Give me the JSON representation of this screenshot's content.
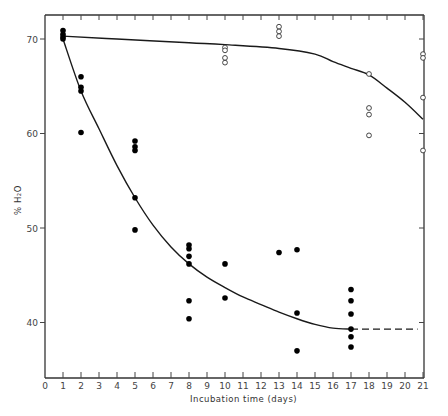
{
  "chart_data": {
    "type": "scatter",
    "title": "",
    "xlabel": "Incubation time (days)",
    "ylabel": "% H2O",
    "xlim": [
      0,
      21
    ],
    "ylim": [
      34,
      72
    ],
    "x_ticks": [
      0,
      1,
      2,
      3,
      4,
      5,
      6,
      7,
      8,
      9,
      10,
      11,
      12,
      13,
      14,
      15,
      16,
      17,
      18,
      19,
      20,
      21
    ],
    "y_ticks": [
      40,
      50,
      60,
      70
    ],
    "grid": false,
    "legend": null,
    "series": [
      {
        "name": "open-circles",
        "marker": "open circle",
        "points": [
          [
            10,
            69.1
          ],
          [
            10,
            68.8
          ],
          [
            10,
            68.0
          ],
          [
            10,
            67.5
          ],
          [
            13,
            71.3
          ],
          [
            13,
            70.8
          ],
          [
            13,
            70.3
          ],
          [
            18,
            66.3
          ],
          [
            18,
            62.7
          ],
          [
            18,
            62.0
          ],
          [
            18,
            59.8
          ],
          [
            21,
            68.4
          ],
          [
            21,
            68.0
          ],
          [
            21,
            63.8
          ],
          [
            21,
            58.2
          ]
        ]
      },
      {
        "name": "filled-circles",
        "marker": "filled circle",
        "points": [
          [
            1,
            70.9
          ],
          [
            1,
            70.5
          ],
          [
            1,
            70.2
          ],
          [
            1,
            70.0
          ],
          [
            2,
            66.0
          ],
          [
            2,
            64.9
          ],
          [
            2,
            64.5
          ],
          [
            2,
            60.1
          ],
          [
            5,
            59.2
          ],
          [
            5,
            58.6
          ],
          [
            5,
            58.2
          ],
          [
            5,
            53.2
          ],
          [
            5,
            49.8
          ],
          [
            8,
            48.2
          ],
          [
            8,
            47.8
          ],
          [
            8,
            47.0
          ],
          [
            8,
            46.2
          ],
          [
            8,
            42.3
          ],
          [
            8,
            40.4
          ],
          [
            10,
            46.2
          ],
          [
            10,
            42.6
          ],
          [
            13,
            47.4
          ],
          [
            14,
            47.7
          ],
          [
            14,
            41.0
          ],
          [
            14,
            37.0
          ],
          [
            17,
            43.5
          ],
          [
            17,
            42.3
          ],
          [
            17,
            40.9
          ],
          [
            17,
            39.3
          ],
          [
            17,
            38.5
          ],
          [
            17,
            37.4
          ]
        ]
      }
    ],
    "fitted_curves": [
      {
        "name": "open-circles-fit",
        "style": "solid",
        "points": [
          [
            1,
            70.3
          ],
          [
            4,
            70.0
          ],
          [
            8,
            69.6
          ],
          [
            10,
            69.4
          ],
          [
            13,
            69.0
          ],
          [
            15,
            68.4
          ],
          [
            16,
            67.6
          ],
          [
            17,
            66.9
          ],
          [
            18,
            66.2
          ],
          [
            19,
            64.8
          ],
          [
            20,
            63.3
          ],
          [
            21,
            61.5
          ]
        ]
      },
      {
        "name": "filled-circles-fit",
        "style": "solid",
        "points": [
          [
            1,
            70.0
          ],
          [
            2,
            64.5
          ],
          [
            3,
            60.5
          ],
          [
            4,
            56.6
          ],
          [
            5,
            53.2
          ],
          [
            6,
            50.3
          ],
          [
            7,
            48.0
          ],
          [
            8,
            46.2
          ],
          [
            9,
            44.8
          ],
          [
            10,
            43.7
          ],
          [
            11,
            42.7
          ],
          [
            12,
            41.9
          ],
          [
            13,
            41.1
          ],
          [
            14,
            40.4
          ],
          [
            15,
            39.8
          ],
          [
            16,
            39.4
          ],
          [
            17,
            39.3
          ]
        ]
      },
      {
        "name": "filled-circles-extrapolation",
        "style": "dashed",
        "points": [
          [
            17,
            39.3
          ],
          [
            20.7,
            39.3
          ]
        ]
      }
    ]
  },
  "axes": {
    "xlabel": "Incubation time (days)",
    "ylabel": "% H₂O"
  }
}
